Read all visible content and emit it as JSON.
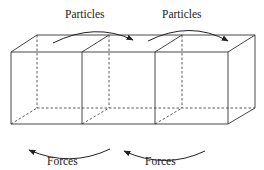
{
  "diagram": {
    "boxes": [
      {
        "id": "box-1"
      },
      {
        "id": "box-2"
      },
      {
        "id": "box-3"
      }
    ],
    "top_labels": [
      {
        "text": "Particles"
      },
      {
        "text": "Particles"
      }
    ],
    "bottom_labels": [
      {
        "text": "Forces"
      },
      {
        "text": "Forces"
      }
    ],
    "arrow_direction": {
      "particles": "left-to-right",
      "forces": "right-to-left"
    },
    "colors": {
      "line": "#333333",
      "text": "#222222",
      "background": "#ffffff"
    }
  }
}
